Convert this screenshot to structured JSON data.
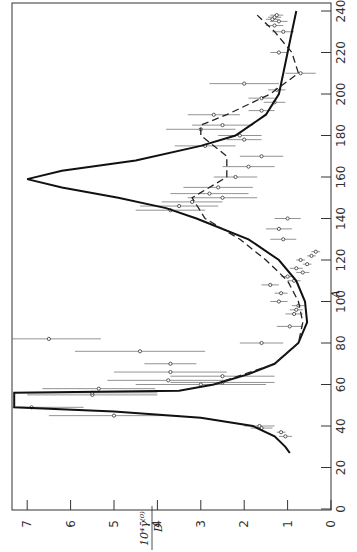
{
  "chart_data": {
    "type": "line",
    "orientation": "rotated-90",
    "title": "",
    "xlabel": "A",
    "ylabel": "10^4 γ̄^(0) / D",
    "ylabel_parts": {
      "numerator": "10⁴γ̄⁽⁰⁾",
      "denominator": "D"
    },
    "xlim": [
      0,
      245
    ],
    "ylim": [
      0,
      7.3
    ],
    "x_ticks": [
      0,
      20,
      40,
      60,
      80,
      100,
      120,
      140,
      160,
      180,
      200,
      220,
      240
    ],
    "y_ticks": [
      0,
      1,
      2,
      3,
      4,
      5,
      6,
      7
    ],
    "grid": false,
    "legend": null,
    "series": [
      {
        "name": "solid-curve",
        "style": "solid",
        "x": [
          27,
          30,
          35,
          40,
          44,
          47,
          49,
          51,
          52,
          54,
          55.5,
          56,
          57,
          60,
          65,
          70,
          80,
          90,
          100,
          110,
          120,
          130,
          140,
          145,
          150,
          155,
          159,
          163,
          168,
          175,
          180,
          190,
          200,
          210,
          220,
          230,
          240
        ],
        "y": [
          0.95,
          1.05,
          1.3,
          1.8,
          3.0,
          5.0,
          7.3,
          7.3,
          7.3,
          7.3,
          7.3,
          7.3,
          3.5,
          2.7,
          1.9,
          1.3,
          0.75,
          0.55,
          0.6,
          0.8,
          1.2,
          1.9,
          3.1,
          3.8,
          4.9,
          6.2,
          7.0,
          6.2,
          4.5,
          3.0,
          2.2,
          1.5,
          1.2,
          1.1,
          1.0,
          0.9,
          0.8
        ]
      },
      {
        "name": "dashed-curve",
        "style": "dashed",
        "x": [
          60,
          70,
          80,
          90,
          100,
          110,
          120,
          130,
          140,
          150,
          160,
          170,
          180,
          185,
          190,
          200,
          210,
          220,
          230,
          238
        ],
        "y": [
          2.7,
          1.3,
          0.75,
          0.65,
          0.75,
          1.0,
          1.5,
          2.1,
          2.9,
          3.2,
          2.4,
          2.4,
          3.0,
          3.0,
          2.4,
          1.4,
          0.75,
          0.9,
          1.3,
          1.7
        ]
      },
      {
        "name": "measurements",
        "style": "points-with-horizontal-error-bars",
        "points": [
          {
            "A": 35,
            "y": 1.05,
            "err": 0.15
          },
          {
            "A": 37,
            "y": 1.15,
            "err": 0.1
          },
          {
            "A": 39,
            "y": 1.6,
            "err": 0.25
          },
          {
            "A": 40,
            "y": 1.65,
            "err": 0.35
          },
          {
            "A": 45,
            "y": 5.0,
            "err": 1.5
          },
          {
            "A": 49,
            "y": 6.9,
            "err": 1.2
          },
          {
            "A": 55,
            "y": 5.5,
            "err": 1.5
          },
          {
            "A": 56,
            "y": 5.5,
            "err": 1.5
          },
          {
            "A": 58,
            "y": 5.35,
            "err": 1.3
          },
          {
            "A": 60,
            "y": 3.0,
            "err": 1.5
          },
          {
            "A": 61,
            "y": 2.5,
            "err": 1.2
          },
          {
            "A": 62,
            "y": 3.75,
            "err": 1.4
          },
          {
            "A": 64,
            "y": 2.5,
            "err": 1.2
          },
          {
            "A": 66,
            "y": 3.7,
            "err": 1.3
          },
          {
            "A": 70,
            "y": 3.7,
            "err": 0.6
          },
          {
            "A": 76,
            "y": 4.4,
            "err": 1.5
          },
          {
            "A": 80,
            "y": 1.6,
            "err": 0.5
          },
          {
            "A": 82,
            "y": 6.5,
            "err": 1.2
          },
          {
            "A": 88,
            "y": 0.95,
            "err": 0.3
          },
          {
            "A": 94,
            "y": 0.85,
            "err": 0.2
          },
          {
            "A": 96,
            "y": 0.8,
            "err": 0.15
          },
          {
            "A": 98,
            "y": 0.75,
            "err": 0.15
          },
          {
            "A": 100,
            "y": 1.2,
            "err": 0.2
          },
          {
            "A": 104,
            "y": 1.15,
            "err": 0.15
          },
          {
            "A": 108,
            "y": 1.4,
            "err": 0.2
          },
          {
            "A": 110,
            "y": 0.85,
            "err": 0.15
          },
          {
            "A": 112,
            "y": 1.0,
            "err": 0.15
          },
          {
            "A": 114,
            "y": 0.65,
            "err": 0.15
          },
          {
            "A": 116,
            "y": 0.8,
            "err": 0.15
          },
          {
            "A": 118,
            "y": 0.55,
            "err": 0.1
          },
          {
            "A": 120,
            "y": 0.7,
            "err": 0.1
          },
          {
            "A": 122,
            "y": 0.45,
            "err": 0.1
          },
          {
            "A": 124,
            "y": 0.35,
            "err": 0.1
          },
          {
            "A": 130,
            "y": 1.1,
            "err": 0.3
          },
          {
            "A": 135,
            "y": 1.2,
            "err": 0.3
          },
          {
            "A": 140,
            "y": 1.0,
            "err": 0.3
          },
          {
            "A": 144,
            "y": 3.7,
            "err": 0.8
          },
          {
            "A": 146,
            "y": 3.5,
            "err": 0.9
          },
          {
            "A": 148,
            "y": 3.2,
            "err": 0.7
          },
          {
            "A": 150,
            "y": 2.5,
            "err": 0.8
          },
          {
            "A": 152,
            "y": 2.8,
            "err": 0.9
          },
          {
            "A": 155,
            "y": 2.6,
            "err": 0.8
          },
          {
            "A": 160,
            "y": 2.2,
            "err": 0.5
          },
          {
            "A": 165,
            "y": 1.9,
            "err": 0.6
          },
          {
            "A": 170,
            "y": 1.6,
            "err": 0.5
          },
          {
            "A": 175,
            "y": 2.9,
            "err": 0.7
          },
          {
            "A": 178,
            "y": 2.0,
            "err": 0.4
          },
          {
            "A": 180,
            "y": 2.1,
            "err": 0.5
          },
          {
            "A": 183,
            "y": 3.0,
            "err": 0.8
          },
          {
            "A": 185,
            "y": 2.5,
            "err": 0.7
          },
          {
            "A": 190,
            "y": 2.7,
            "err": 0.6
          },
          {
            "A": 192,
            "y": 1.6,
            "err": 0.3
          },
          {
            "A": 196,
            "y": 1.3,
            "err": 0.25
          },
          {
            "A": 198,
            "y": 1.6,
            "err": 0.3
          },
          {
            "A": 202,
            "y": 1.25,
            "err": 0.2
          },
          {
            "A": 205,
            "y": 2.0,
            "err": 0.8
          },
          {
            "A": 210,
            "y": 0.7,
            "err": 0.35
          },
          {
            "A": 220,
            "y": 1.2,
            "err": 0.2
          },
          {
            "A": 230,
            "y": 1.1,
            "err": 0.25
          },
          {
            "A": 233,
            "y": 1.3,
            "err": 0.2
          },
          {
            "A": 235,
            "y": 1.2,
            "err": 0.2
          },
          {
            "A": 236,
            "y": 1.35,
            "err": 0.15
          },
          {
            "A": 237,
            "y": 1.3,
            "err": 0.15
          },
          {
            "A": 238,
            "y": 1.25,
            "err": 0.15
          }
        ]
      }
    ]
  },
  "axes": {
    "a_axis_title": "A",
    "a_tick_labels": [
      "0",
      "20",
      "40",
      "60",
      "80",
      "100",
      "120",
      "140",
      "160",
      "180",
      "200",
      "220",
      "240"
    ],
    "y_tick_labels": [
      "0",
      "1",
      "2",
      "3",
      "4",
      "5",
      "6",
      "7"
    ],
    "y_title_numerator": "10⁴γ̄⁽⁰⁾",
    "y_title_denominator": "D"
  }
}
